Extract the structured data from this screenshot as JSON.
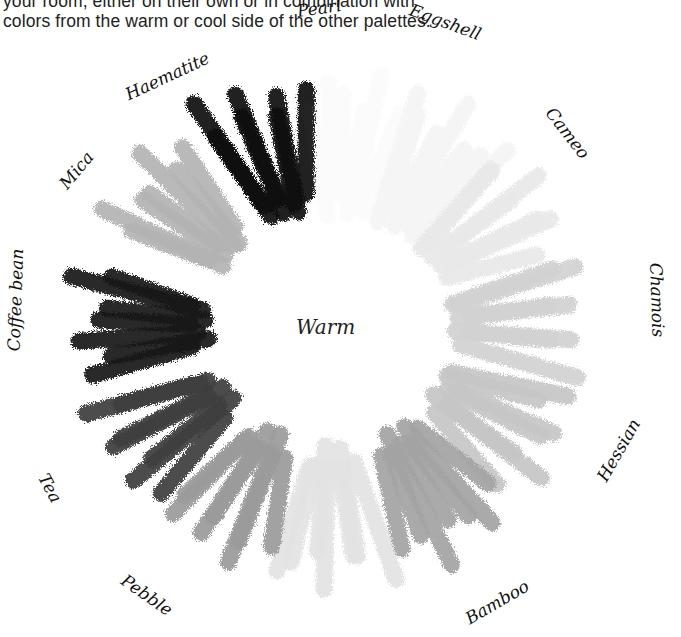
{
  "intro_text": {
    "line1": "your room, either on their own or in combination with",
    "line2": "colors from the warm or cool side of the other palettes."
  },
  "wheel": {
    "center_label": "Warm",
    "center": [
      330,
      330
    ],
    "swatches": [
      {
        "name": "Pearl",
        "color": "#fbfbfb",
        "angle": 8
      },
      {
        "name": "Eggshell",
        "color": "#f5f5f5",
        "angle": 32
      },
      {
        "name": "Cameo",
        "color": "#e9e9e9",
        "angle": 56
      },
      {
        "name": "Chamois",
        "color": "#d2d2d2",
        "angle": 86
      },
      {
        "name": "Hessian",
        "color": "#c6c6c6",
        "angle": 118
      },
      {
        "name": "Bamboo",
        "color": "#a3a3a3",
        "angle": 148
      },
      {
        "name": "",
        "color": "#e3e3e3",
        "angle": 180
      },
      {
        "name": "Pebble",
        "color": "#9b9b9b",
        "angle": 210
      },
      {
        "name": "Tea",
        "color": "#3d3d3d",
        "angle": 240
      },
      {
        "name": "Coffee bean",
        "color": "#151515",
        "angle": 272
      },
      {
        "name": "Mica",
        "color": "#b3b3b3",
        "angle": 308
      },
      {
        "name": "Haematite",
        "color": "#121212",
        "angle": 340
      }
    ]
  },
  "labels": {
    "pearl": "Pearl",
    "eggshell": "Eggshell",
    "cameo": "Cameo",
    "chamois": "Chamois",
    "hessian": "Hessian",
    "bamboo": "Bamboo",
    "pebble": "Pebble",
    "tea": "Tea",
    "coffee_bean": "Coffee bean",
    "mica": "Mica",
    "haematite": "Haematite"
  }
}
